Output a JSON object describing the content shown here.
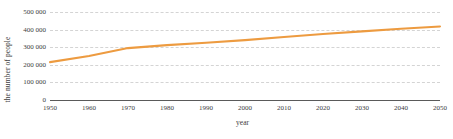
{
  "chart_data": {
    "type": "line",
    "title": "",
    "xlabel": "year",
    "ylabel": "the number of people",
    "x": [
      1950,
      1960,
      1970,
      1980,
      1990,
      2000,
      2010,
      2020,
      2030,
      2040,
      2050
    ],
    "values": [
      215000,
      250000,
      295000,
      312000,
      325000,
      340000,
      358000,
      375000,
      390000,
      405000,
      418000
    ],
    "series": [
      {
        "name": "the number of people",
        "color": "#ED9B40",
        "values": [
          215000,
          250000,
          295000,
          312000,
          325000,
          340000,
          358000,
          375000,
          390000,
          405000,
          418000
        ]
      }
    ],
    "xlim": [
      1950,
      2050
    ],
    "ylim": [
      0,
      500000
    ],
    "xticks": [
      1950,
      1960,
      1970,
      1980,
      1990,
      2000,
      2010,
      2020,
      2030,
      2040,
      2050
    ],
    "xtick_labels": [
      "1950",
      "1960",
      "1970",
      "1980",
      "1990",
      "2000",
      "2010",
      "2020",
      "2030",
      "2040",
      "2050"
    ],
    "yticks": [
      0,
      100000,
      200000,
      300000,
      400000,
      500000
    ],
    "ytick_labels": [
      "0",
      "100 000",
      "200 000",
      "300 000",
      "400 000",
      "500 000"
    ],
    "grid": "horizontal-dashed",
    "legend": "none",
    "line_color": "#ED9B40",
    "grid_color": "#D4D4D4",
    "axis_color": "#5A5A5A"
  }
}
